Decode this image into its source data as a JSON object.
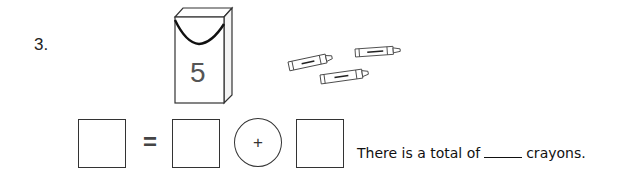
{
  "question": {
    "number": "3.",
    "crayon_box": {
      "label": "5",
      "icon": "crayon-box-icon"
    },
    "loose_crayons": {
      "count": 3,
      "icon": "crayon-icon"
    },
    "equation": {
      "equals_sign": "=",
      "operator": "+",
      "boxes": [
        "",
        "",
        ""
      ]
    },
    "sentence": {
      "prefix": "There is a total of",
      "blank": "",
      "suffix": "crayons."
    }
  }
}
